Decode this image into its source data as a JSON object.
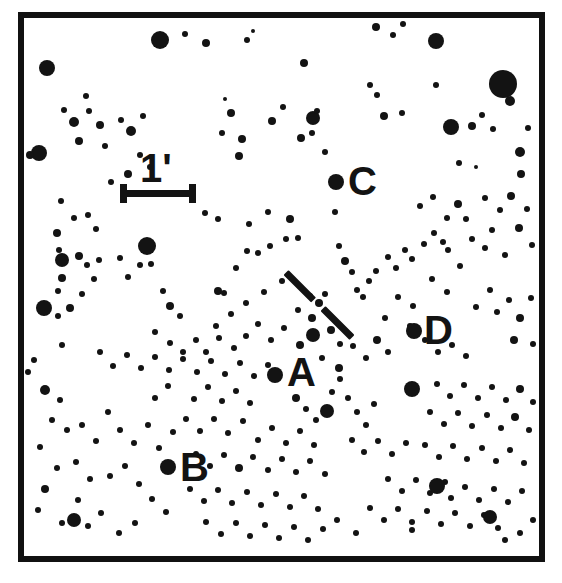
{
  "chart": {
    "type": "finder-chart",
    "background_color": "#ffffff",
    "ink_color": "#131313",
    "frame": {
      "x": 18,
      "y": 12,
      "width": 527,
      "height": 550,
      "border_width": 6
    }
  },
  "scale_bar": {
    "label": "1'",
    "label_x": 140,
    "label_y": 148,
    "bar_x": 120,
    "bar_y": 193,
    "bar_length": 76,
    "bar_thickness": 7,
    "cap_height": 19,
    "cap_width": 7
  },
  "target_marker": {
    "name": "target-tick-mark",
    "x1": 286,
    "y1": 272,
    "x2": 352,
    "y2": 338,
    "thickness": 7,
    "gap_start": 0.42,
    "gap_end": 0.56
  },
  "comparison_stars": [
    {
      "id": "A",
      "label": "A",
      "label_x": 287,
      "label_y": 352,
      "star_x": 275,
      "star_y": 375,
      "star_r": 8
    },
    {
      "id": "B",
      "label": "B",
      "label_x": 180,
      "label_y": 447,
      "star_x": 168,
      "star_y": 467,
      "star_r": 8
    },
    {
      "id": "C",
      "label": "C",
      "label_x": 348,
      "label_y": 161,
      "star_x": 336,
      "star_y": 182,
      "star_r": 8
    },
    {
      "id": "D",
      "label": "D",
      "label_x": 424,
      "label_y": 310,
      "star_x": 414,
      "star_y": 331,
      "star_r": 8
    }
  ],
  "stars": [
    [
      47,
      68,
      8
    ],
    [
      86,
      96,
      3
    ],
    [
      160,
      40,
      9
    ],
    [
      185,
      34,
      3
    ],
    [
      206,
      43,
      4
    ],
    [
      247,
      40,
      3
    ],
    [
      253,
      31,
      2
    ],
    [
      304,
      63,
      4
    ],
    [
      313,
      118,
      7
    ],
    [
      376,
      27,
      4
    ],
    [
      393,
      35,
      3
    ],
    [
      403,
      24,
      3
    ],
    [
      436,
      41,
      8
    ],
    [
      503,
      84,
      14
    ],
    [
      510,
      101,
      5
    ],
    [
      39,
      153,
      8
    ],
    [
      30,
      155,
      4
    ],
    [
      64,
      110,
      3
    ],
    [
      74,
      122,
      5
    ],
    [
      89,
      111,
      3
    ],
    [
      100,
      125,
      4
    ],
    [
      79,
      141,
      4
    ],
    [
      105,
      146,
      3
    ],
    [
      121,
      120,
      3
    ],
    [
      131,
      131,
      5
    ],
    [
      143,
      116,
      3
    ],
    [
      140,
      155,
      3
    ],
    [
      150,
      167,
      3
    ],
    [
      128,
      174,
      4
    ],
    [
      111,
      182,
      3
    ],
    [
      225,
      99,
      2
    ],
    [
      231,
      113,
      4
    ],
    [
      222,
      133,
      3
    ],
    [
      242,
      139,
      4
    ],
    [
      239,
      156,
      4
    ],
    [
      272,
      121,
      4
    ],
    [
      283,
      107,
      3
    ],
    [
      301,
      138,
      4
    ],
    [
      312,
      133,
      3
    ],
    [
      317,
      111,
      3
    ],
    [
      325,
      152,
      3
    ],
    [
      370,
      85,
      3
    ],
    [
      377,
      95,
      3
    ],
    [
      384,
      116,
      4
    ],
    [
      402,
      113,
      3
    ],
    [
      436,
      85,
      3
    ],
    [
      451,
      127,
      8
    ],
    [
      472,
      126,
      4
    ],
    [
      482,
      115,
      3
    ],
    [
      493,
      129,
      3
    ],
    [
      520,
      152,
      5
    ],
    [
      528,
      128,
      3
    ],
    [
      459,
      163,
      3
    ],
    [
      476,
      167,
      2
    ],
    [
      521,
      174,
      4
    ],
    [
      61,
      201,
      3
    ],
    [
      74,
      218,
      3
    ],
    [
      57,
      233,
      4
    ],
    [
      88,
      215,
      3
    ],
    [
      96,
      229,
      3
    ],
    [
      59,
      250,
      3
    ],
    [
      79,
      256,
      4
    ],
    [
      62,
      278,
      4
    ],
    [
      58,
      291,
      3
    ],
    [
      44,
      308,
      8
    ],
    [
      58,
      316,
      3
    ],
    [
      70,
      308,
      4
    ],
    [
      82,
      294,
      3
    ],
    [
      94,
      279,
      3
    ],
    [
      62,
      345,
      3
    ],
    [
      147,
      246,
      9
    ],
    [
      151,
      264,
      3
    ],
    [
      128,
      277,
      3
    ],
    [
      62,
      260,
      7
    ],
    [
      87,
      265,
      3
    ],
    [
      99,
      260,
      3
    ],
    [
      120,
      258,
      3
    ],
    [
      140,
      265,
      3
    ],
    [
      163,
      291,
      3
    ],
    [
      170,
      306,
      4
    ],
    [
      180,
      316,
      3
    ],
    [
      155,
      332,
      3
    ],
    [
      218,
      291,
      4
    ],
    [
      224,
      293,
      3
    ],
    [
      236,
      268,
      3
    ],
    [
      247,
      251,
      3
    ],
    [
      258,
      253,
      3
    ],
    [
      270,
      246,
      3
    ],
    [
      286,
      239,
      3
    ],
    [
      298,
      238,
      3
    ],
    [
      205,
      213,
      3
    ],
    [
      218,
      219,
      3
    ],
    [
      249,
      224,
      3
    ],
    [
      268,
      212,
      3
    ],
    [
      290,
      219,
      4
    ],
    [
      335,
      212,
      3
    ],
    [
      339,
      246,
      3
    ],
    [
      345,
      261,
      4
    ],
    [
      352,
      272,
      3
    ],
    [
      357,
      290,
      3
    ],
    [
      363,
      297,
      3
    ],
    [
      369,
      281,
      3
    ],
    [
      376,
      271,
      3
    ],
    [
      388,
      257,
      3
    ],
    [
      396,
      268,
      3
    ],
    [
      405,
      250,
      3
    ],
    [
      412,
      259,
      3
    ],
    [
      424,
      244,
      3
    ],
    [
      434,
      233,
      3
    ],
    [
      448,
      250,
      3
    ],
    [
      460,
      266,
      3
    ],
    [
      472,
      239,
      3
    ],
    [
      485,
      248,
      3
    ],
    [
      492,
      230,
      3
    ],
    [
      505,
      255,
      3
    ],
    [
      519,
      228,
      4
    ],
    [
      532,
      245,
      3
    ],
    [
      476,
      307,
      3
    ],
    [
      490,
      290,
      3
    ],
    [
      497,
      312,
      3
    ],
    [
      509,
      300,
      3
    ],
    [
      520,
      318,
      4
    ],
    [
      531,
      298,
      3
    ],
    [
      514,
      340,
      4
    ],
    [
      533,
      344,
      3
    ],
    [
      420,
      206,
      3
    ],
    [
      433,
      197,
      3
    ],
    [
      447,
      218,
      3
    ],
    [
      458,
      204,
      4
    ],
    [
      466,
      219,
      3
    ],
    [
      443,
      242,
      3
    ],
    [
      485,
      198,
      3
    ],
    [
      500,
      210,
      3
    ],
    [
      511,
      196,
      4
    ],
    [
      527,
      209,
      3
    ],
    [
      447,
      292,
      3
    ],
    [
      432,
      279,
      3
    ],
    [
      413,
      306,
      3
    ],
    [
      398,
      297,
      3
    ],
    [
      385,
      318,
      3
    ],
    [
      410,
      326,
      3
    ],
    [
      425,
      340,
      3
    ],
    [
      438,
      352,
      3
    ],
    [
      452,
      345,
      3
    ],
    [
      466,
      356,
      3
    ],
    [
      331,
      330,
      4
    ],
    [
      340,
      344,
      3
    ],
    [
      313,
      335,
      7
    ],
    [
      300,
      345,
      4
    ],
    [
      322,
      358,
      3
    ],
    [
      339,
      368,
      4
    ],
    [
      353,
      346,
      3
    ],
    [
      366,
      358,
      3
    ],
    [
      377,
      340,
      4
    ],
    [
      388,
      352,
      3
    ],
    [
      312,
      318,
      4
    ],
    [
      298,
      310,
      3
    ],
    [
      319,
      303,
      4
    ],
    [
      310,
      296,
      3
    ],
    [
      325,
      294,
      3
    ],
    [
      284,
      328,
      3
    ],
    [
      271,
      340,
      3
    ],
    [
      258,
      324,
      3
    ],
    [
      246,
      336,
      3
    ],
    [
      234,
      348,
      3
    ],
    [
      219,
      338,
      3
    ],
    [
      206,
      352,
      3
    ],
    [
      196,
      340,
      3
    ],
    [
      183,
      352,
      3
    ],
    [
      170,
      343,
      3
    ],
    [
      45,
      390,
      5
    ],
    [
      60,
      400,
      3
    ],
    [
      52,
      420,
      3
    ],
    [
      67,
      430,
      3
    ],
    [
      40,
      447,
      3
    ],
    [
      57,
      468,
      3
    ],
    [
      45,
      489,
      4
    ],
    [
      38,
      510,
      3
    ],
    [
      62,
      523,
      3
    ],
    [
      78,
      500,
      3
    ],
    [
      90,
      479,
      3
    ],
    [
      76,
      462,
      3
    ],
    [
      96,
      441,
      3
    ],
    [
      82,
      425,
      3
    ],
    [
      108,
      412,
      3
    ],
    [
      120,
      430,
      3
    ],
    [
      134,
      443,
      3
    ],
    [
      148,
      425,
      3
    ],
    [
      159,
      448,
      3
    ],
    [
      173,
      432,
      3
    ],
    [
      125,
      466,
      3
    ],
    [
      110,
      476,
      3
    ],
    [
      139,
      484,
      3
    ],
    [
      152,
      499,
      3
    ],
    [
      166,
      512,
      3
    ],
    [
      101,
      513,
      3
    ],
    [
      88,
      526,
      3
    ],
    [
      74,
      520,
      7
    ],
    [
      119,
      533,
      3
    ],
    [
      135,
      523,
      3
    ],
    [
      194,
      399,
      3
    ],
    [
      208,
      387,
      3
    ],
    [
      222,
      401,
      3
    ],
    [
      236,
      391,
      3
    ],
    [
      250,
      403,
      3
    ],
    [
      186,
      419,
      3
    ],
    [
      200,
      431,
      3
    ],
    [
      214,
      419,
      3
    ],
    [
      228,
      433,
      3
    ],
    [
      243,
      421,
      3
    ],
    [
      258,
      440,
      3
    ],
    [
      272,
      428,
      3
    ],
    [
      286,
      443,
      3
    ],
    [
      300,
      431,
      3
    ],
    [
      314,
      445,
      3
    ],
    [
      196,
      454,
      3
    ],
    [
      210,
      466,
      3
    ],
    [
      224,
      455,
      3
    ],
    [
      239,
      468,
      4
    ],
    [
      253,
      457,
      3
    ],
    [
      268,
      470,
      3
    ],
    [
      282,
      459,
      3
    ],
    [
      296,
      472,
      3
    ],
    [
      310,
      461,
      3
    ],
    [
      325,
      474,
      3
    ],
    [
      190,
      489,
      3
    ],
    [
      204,
      501,
      3
    ],
    [
      218,
      490,
      3
    ],
    [
      232,
      503,
      3
    ],
    [
      247,
      492,
      3
    ],
    [
      261,
      505,
      3
    ],
    [
      276,
      494,
      3
    ],
    [
      290,
      507,
      3
    ],
    [
      304,
      496,
      3
    ],
    [
      318,
      509,
      3
    ],
    [
      206,
      522,
      3
    ],
    [
      221,
      534,
      3
    ],
    [
      236,
      523,
      3
    ],
    [
      250,
      536,
      3
    ],
    [
      265,
      525,
      3
    ],
    [
      279,
      538,
      3
    ],
    [
      294,
      527,
      3
    ],
    [
      308,
      540,
      3
    ],
    [
      323,
      529,
      3
    ],
    [
      337,
      520,
      3
    ],
    [
      296,
      398,
      4
    ],
    [
      306,
      409,
      3
    ],
    [
      316,
      420,
      3
    ],
    [
      327,
      411,
      7
    ],
    [
      332,
      392,
      3
    ],
    [
      340,
      379,
      3
    ],
    [
      348,
      398,
      3
    ],
    [
      357,
      412,
      3
    ],
    [
      366,
      425,
      3
    ],
    [
      374,
      404,
      3
    ],
    [
      352,
      440,
      3
    ],
    [
      364,
      452,
      3
    ],
    [
      378,
      441,
      3
    ],
    [
      392,
      454,
      3
    ],
    [
      406,
      443,
      3
    ],
    [
      388,
      479,
      3
    ],
    [
      402,
      491,
      3
    ],
    [
      416,
      480,
      3
    ],
    [
      430,
      493,
      3
    ],
    [
      445,
      482,
      3
    ],
    [
      370,
      508,
      3
    ],
    [
      384,
      520,
      3
    ],
    [
      398,
      509,
      3
    ],
    [
      412,
      522,
      3
    ],
    [
      427,
      511,
      3
    ],
    [
      441,
      524,
      3
    ],
    [
      455,
      513,
      3
    ],
    [
      470,
      526,
      3
    ],
    [
      484,
      515,
      3
    ],
    [
      498,
      528,
      3
    ],
    [
      356,
      533,
      3
    ],
    [
      412,
      389,
      8
    ],
    [
      437,
      384,
      3
    ],
    [
      450,
      396,
      3
    ],
    [
      464,
      385,
      3
    ],
    [
      478,
      398,
      3
    ],
    [
      492,
      387,
      3
    ],
    [
      506,
      400,
      3
    ],
    [
      520,
      389,
      4
    ],
    [
      533,
      402,
      3
    ],
    [
      430,
      412,
      3
    ],
    [
      444,
      424,
      3
    ],
    [
      458,
      413,
      3
    ],
    [
      472,
      426,
      3
    ],
    [
      487,
      415,
      3
    ],
    [
      501,
      428,
      3
    ],
    [
      515,
      417,
      4
    ],
    [
      529,
      430,
      3
    ],
    [
      425,
      445,
      3
    ],
    [
      439,
      457,
      3
    ],
    [
      453,
      446,
      3
    ],
    [
      467,
      459,
      3
    ],
    [
      482,
      448,
      3
    ],
    [
      496,
      461,
      3
    ],
    [
      510,
      450,
      3
    ],
    [
      524,
      463,
      3
    ],
    [
      437,
      486,
      8
    ],
    [
      451,
      498,
      3
    ],
    [
      465,
      487,
      3
    ],
    [
      479,
      500,
      3
    ],
    [
      494,
      489,
      3
    ],
    [
      508,
      502,
      3
    ],
    [
      522,
      491,
      3
    ],
    [
      490,
      517,
      7
    ],
    [
      412,
      530,
      3
    ],
    [
      505,
      540,
      3
    ],
    [
      520,
      533,
      3
    ],
    [
      533,
      520,
      3
    ],
    [
      34,
      360,
      3
    ],
    [
      28,
      372,
      3
    ],
    [
      100,
      352,
      3
    ],
    [
      113,
      366,
      3
    ],
    [
      127,
      355,
      3
    ],
    [
      141,
      368,
      3
    ],
    [
      155,
      357,
      3
    ],
    [
      169,
      370,
      3
    ],
    [
      183,
      359,
      3
    ],
    [
      197,
      372,
      3
    ],
    [
      211,
      361,
      3
    ],
    [
      225,
      374,
      3
    ],
    [
      240,
      363,
      3
    ],
    [
      254,
      376,
      3
    ],
    [
      268,
      365,
      3
    ],
    [
      155,
      398,
      3
    ],
    [
      168,
      386,
      3
    ],
    [
      282,
      281,
      3
    ],
    [
      264,
      292,
      3
    ],
    [
      246,
      303,
      3
    ],
    [
      231,
      314,
      3
    ],
    [
      216,
      326,
      3
    ]
  ],
  "accessibility": {
    "title": "Finder chart with scale bar and comparison stars A, B, C, D"
  }
}
